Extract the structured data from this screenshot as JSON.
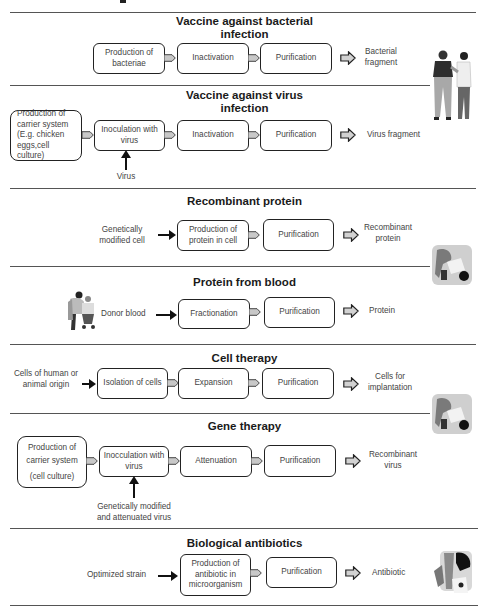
{
  "header_fragment": "",
  "sections": [
    {
      "title": "Vaccine against bacterial infection",
      "title_lines": [
        "Vaccine against bacterial",
        "infection"
      ],
      "steps": [
        "Production of bacteriae",
        "Inactivation",
        "Purification"
      ],
      "output": "Bacterial fragment"
    },
    {
      "title": "Vaccine against virus infection",
      "title_lines": [
        "Vaccine against virus",
        "infection"
      ],
      "start_box": "Production of carrier system (E.g. chicken eggs,cell culture)",
      "steps": [
        "Inoculation with virus",
        "Inactivation",
        "Purification"
      ],
      "input_below": "Virus",
      "output": "Virus fragment"
    },
    {
      "title": "Recombinant protein",
      "input": "Genetically modified cell",
      "steps": [
        "Production of protein in cell",
        "Purification"
      ],
      "output": "Recombinant protein"
    },
    {
      "title": "Protein from blood",
      "input": "Donor blood",
      "steps": [
        "Fractionation",
        "Purification"
      ],
      "output": "Protein"
    },
    {
      "title": "Cell therapy",
      "input": "Cells of human or animal origin",
      "steps": [
        "Isolation of cells",
        "Expansion",
        "Purification"
      ],
      "output": "Cells for implantation"
    },
    {
      "title": "Gene therapy",
      "start_box_lines": [
        "Production of",
        "carrier system",
        "(cell culture)"
      ],
      "steps": [
        "Inocculation with virus",
        "Attenuation",
        "Purification"
      ],
      "input_below": "Genetically modified and attenuated virus",
      "output": "Recombinant virus"
    },
    {
      "title": "Biological antibiotics",
      "input": "Optimized strain",
      "steps": [
        "Production of antibiotic in microorganism",
        "Purification"
      ],
      "output": "Antibiotic"
    }
  ],
  "figures": [
    {
      "name": "doctor-patient-illustration",
      "section": 0
    },
    {
      "name": "lab-worker-illustration",
      "section": 2
    },
    {
      "name": "blood-donor-illustration",
      "section": 3
    },
    {
      "name": "lab-worker-illustration",
      "section": 4
    },
    {
      "name": "lab-worker-illustration",
      "section": 6
    }
  ],
  "colors": {
    "line": "#555555",
    "box_border": "#222222",
    "connector_fill": "#c8c8c8",
    "text": "#444444",
    "title": "#1a1a1a"
  }
}
